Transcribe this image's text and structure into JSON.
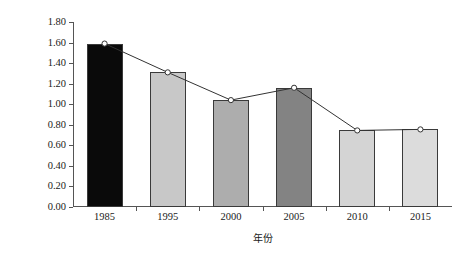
{
  "chart_data": {
    "type": "bar",
    "title": "",
    "xlabel": "年份",
    "ylabel": "模拟径流量/(亿m³)",
    "categories": [
      "1985",
      "1995",
      "2000",
      "2005",
      "2010",
      "2015"
    ],
    "values": [
      1.59,
      1.31,
      1.04,
      1.16,
      0.745,
      0.755
    ],
    "ylim": [
      0.0,
      1.8
    ],
    "ytick_labels": [
      "0.00",
      "0.20",
      "0.40",
      "0.60",
      "0.80",
      "1.00",
      "1.20",
      "1.40",
      "1.60",
      "1.80"
    ],
    "ytick_values": [
      0.0,
      0.2,
      0.4,
      0.6,
      0.8,
      1.0,
      1.2,
      1.4,
      1.6,
      1.8
    ],
    "grid": false,
    "legend": "none",
    "bar_colors": [
      "#0a0a0a",
      "#c8c8c8",
      "#adadad",
      "#838383",
      "#d4d4d4",
      "#dcdcdc"
    ],
    "bar_edge_color": "#3a3a3a",
    "series": [
      {
        "name": "模拟径流量",
        "type": "line",
        "values": [
          1.59,
          1.31,
          1.04,
          1.16,
          0.745,
          0.755
        ],
        "line_color": "#333333",
        "marker": "circle-open",
        "marker_fill": "#ffffff"
      }
    ]
  }
}
